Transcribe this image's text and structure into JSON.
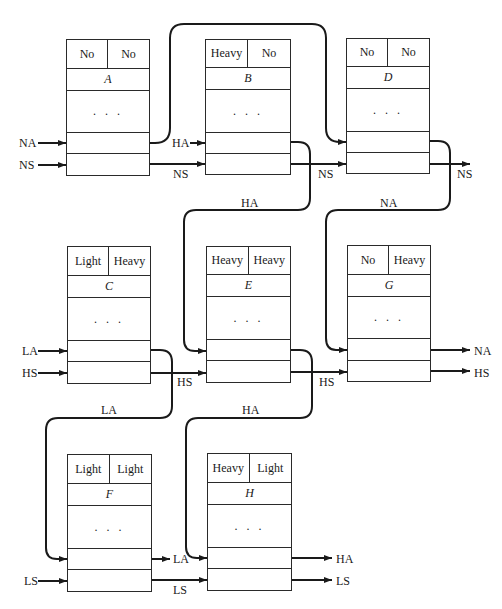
{
  "diagram": {
    "type": "linked-cell-network",
    "nodes": [
      {
        "id": "A",
        "name": "A",
        "left": "No",
        "right": "No",
        "dots": ". . .",
        "x": 66,
        "y": 39,
        "w": 84,
        "h": 137
      },
      {
        "id": "B",
        "name": "B",
        "left": "Heavy",
        "right": "No",
        "dots": ". . .",
        "x": 205,
        "y": 39,
        "w": 86,
        "h": 136
      },
      {
        "id": "D",
        "name": "D",
        "left": "No",
        "right": "No",
        "dots": ". . .",
        "x": 346,
        "y": 38,
        "w": 84,
        "h": 136
      },
      {
        "id": "C",
        "name": "C",
        "left": "Light",
        "right": "Heavy",
        "dots": ". . .",
        "x": 67,
        "y": 246,
        "w": 84,
        "h": 138
      },
      {
        "id": "E",
        "name": "E",
        "left": "Heavy",
        "right": "Heavy",
        "dots": ". . .",
        "x": 206,
        "y": 246,
        "w": 85,
        "h": 137
      },
      {
        "id": "G",
        "name": "G",
        "left": "No",
        "right": "Heavy",
        "dots": ". . .",
        "x": 347,
        "y": 245,
        "w": 84,
        "h": 137
      },
      {
        "id": "F",
        "name": "F",
        "left": "Light",
        "right": "Light",
        "dots": ". . .",
        "x": 67,
        "y": 454,
        "w": 85,
        "h": 138
      },
      {
        "id": "H",
        "name": "H",
        "left": "Heavy",
        "right": "Light",
        "dots": ". . .",
        "x": 207,
        "y": 453,
        "w": 85,
        "h": 138
      }
    ],
    "labels": [
      {
        "id": "in-NA-A",
        "text": "NA",
        "x": 19,
        "y": 137
      },
      {
        "id": "in-NS-A",
        "text": "NS",
        "x": 19,
        "y": 159
      },
      {
        "id": "in-HA-B",
        "text": "HA",
        "x": 172,
        "y": 137
      },
      {
        "id": "mid-NS-AB",
        "text": "NS",
        "x": 173,
        "y": 168
      },
      {
        "id": "mid-NS-BD",
        "text": "NS",
        "x": 318,
        "y": 168
      },
      {
        "id": "out-NS-D",
        "text": "NS",
        "x": 457,
        "y": 168
      },
      {
        "id": "wire-HA-BE",
        "text": "HA",
        "x": 241,
        "y": 197
      },
      {
        "id": "wire-NA-DG",
        "text": "NA",
        "x": 380,
        "y": 197
      },
      {
        "id": "in-LA-C",
        "text": "LA",
        "x": 22,
        "y": 345
      },
      {
        "id": "in-HS-C",
        "text": "HS",
        "x": 22,
        "y": 367
      },
      {
        "id": "mid-HS-CE",
        "text": "HS",
        "x": 177,
        "y": 376
      },
      {
        "id": "mid-HS-EG",
        "text": "HS",
        "x": 319,
        "y": 376
      },
      {
        "id": "out-NA-G",
        "text": "NA",
        "x": 474,
        "y": 345
      },
      {
        "id": "out-HS-G",
        "text": "HS",
        "x": 474,
        "y": 367
      },
      {
        "id": "wire-LA-CF",
        "text": "LA",
        "x": 101,
        "y": 404
      },
      {
        "id": "wire-HA-EH",
        "text": "HA",
        "x": 242,
        "y": 404
      },
      {
        "id": "out-LA-F",
        "text": "LA",
        "x": 173,
        "y": 553
      },
      {
        "id": "in-LS-F",
        "text": "LS",
        "x": 24,
        "y": 575
      },
      {
        "id": "mid-LS-FH",
        "text": "LS",
        "x": 173,
        "y": 584
      },
      {
        "id": "out-HA-H",
        "text": "HA",
        "x": 336,
        "y": 553
      },
      {
        "id": "out-LS-H",
        "text": "LS",
        "x": 336,
        "y": 575
      }
    ],
    "stroke_color": "#1a1a1a"
  }
}
